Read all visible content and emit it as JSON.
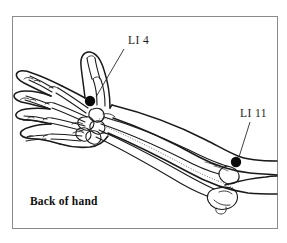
{
  "figure": {
    "background_color": "#ffffff",
    "ink_color": "#1a1a1a",
    "frame_color": "#8a8a8a",
    "frame": {
      "x": 12,
      "y": 16,
      "width": 265,
      "height": 212
    }
  },
  "caption": {
    "text": "Back of hand",
    "x": 30,
    "y": 205
  },
  "labels": [
    {
      "id": "li4",
      "text": "LI 4",
      "x": 128,
      "y": 44,
      "leader": {
        "x1": 124,
        "y1": 49,
        "x2": 96,
        "y2": 97
      },
      "point": {
        "cx": 90,
        "cy": 101,
        "r": 5.2
      }
    },
    {
      "id": "li11",
      "text": "LI 11",
      "x": 240,
      "y": 117,
      "leader": {
        "x1": 250,
        "y1": 122,
        "x2": 239,
        "y2": 157
      },
      "point": {
        "cx": 236,
        "cy": 162,
        "r": 5.2
      }
    }
  ],
  "point_markers": {
    "color": "#0a0a0a",
    "count": 2,
    "names": [
      "LI 4",
      "LI 11"
    ]
  },
  "anatomy": {
    "view": "dorsal (back of hand)",
    "regions": [
      "fingers",
      "metacarpals",
      "carpals",
      "radius",
      "ulna",
      "elbow",
      "upper arm"
    ]
  }
}
